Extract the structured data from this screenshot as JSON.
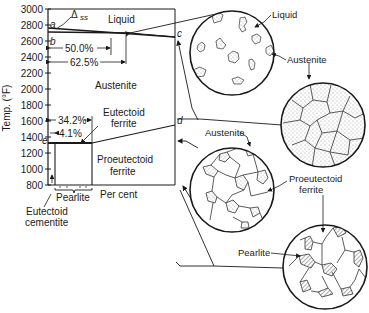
{
  "axis": {
    "ylabel": "Temp. (°F)",
    "xlabel": "Per cent",
    "yticks": [
      "3000",
      "2800",
      "2600",
      "2400",
      "2200",
      "2000",
      "1800",
      "1600",
      "1400",
      "1200",
      "1000",
      "800"
    ]
  },
  "points": {
    "a": "a",
    "b": "b",
    "c": "c",
    "d": "d",
    "e": "e"
  },
  "regions": {
    "liquid": "Liquid",
    "austenite": "Austenite",
    "eutectoid_ferrite_1": "Eutectoid",
    "eutectoid_ferrite_2": "ferrite",
    "proeutectoid_ferrite_1": "Proeutectoid",
    "proeutectoid_ferrite_2": "ferrite"
  },
  "annotations": {
    "delta_ss": "Δ",
    "delta_ss_sub": "ss",
    "pct_50": "50.0%",
    "pct_625": "62.5%",
    "pct_342": "34.2%",
    "pct_41": "4.1%",
    "pearlite": "Pearlite",
    "eutectoid_cementite_1": "Eutectoid",
    "eutectoid_cementite_2": "cementite"
  },
  "circles": [
    {
      "labels": [
        "Liquid",
        "Austenite"
      ]
    },
    {
      "labels": [
        "Austenite"
      ]
    },
    {
      "labels": [
        "Austenite",
        "Proeutectoid",
        "ferrite"
      ]
    },
    {
      "labels": [
        "Pearlite"
      ]
    }
  ]
}
